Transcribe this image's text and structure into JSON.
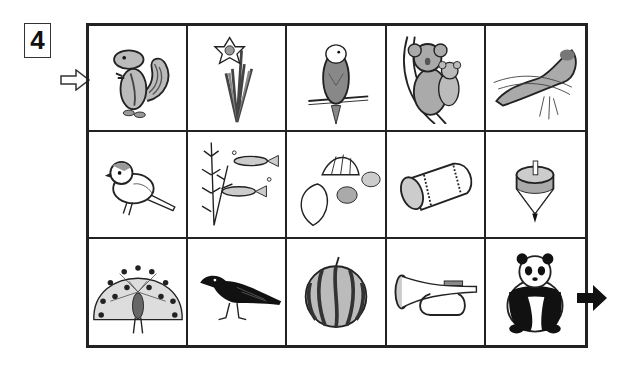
{
  "puzzle": {
    "number": "4",
    "start_icon": "white-arrow-right-icon",
    "end_icon": "black-arrow-right-icon"
  },
  "grid": {
    "rows": 3,
    "cols": 5,
    "cells": [
      {
        "label": "chipmunk",
        "icon": "chipmunk-icon"
      },
      {
        "label": "daffodil",
        "icon": "daffodil-icon"
      },
      {
        "label": "budgerigar",
        "icon": "budgerigar-icon"
      },
      {
        "label": "koala",
        "icon": "koala-icon"
      },
      {
        "label": "sea otter",
        "icon": "sea-otter-icon"
      },
      {
        "label": "sparrow",
        "icon": "sparrow-icon"
      },
      {
        "label": "medaka",
        "icon": "medaka-fish-icon"
      },
      {
        "label": "seashells",
        "icon": "seashells-icon"
      },
      {
        "label": "drum",
        "icon": "drum-icon"
      },
      {
        "label": "spinning top",
        "icon": "spinning-top-icon"
      },
      {
        "label": "peacock",
        "icon": "peacock-icon"
      },
      {
        "label": "crow",
        "icon": "crow-icon"
      },
      {
        "label": "watermelon",
        "icon": "watermelon-icon"
      },
      {
        "label": "bugle",
        "icon": "bugle-icon"
      },
      {
        "label": "panda",
        "icon": "panda-icon"
      }
    ]
  },
  "colors": {
    "grid_line": "#222222",
    "fill_gray": "#b0b0b0",
    "dark_gray": "#777777",
    "black": "#111111"
  }
}
